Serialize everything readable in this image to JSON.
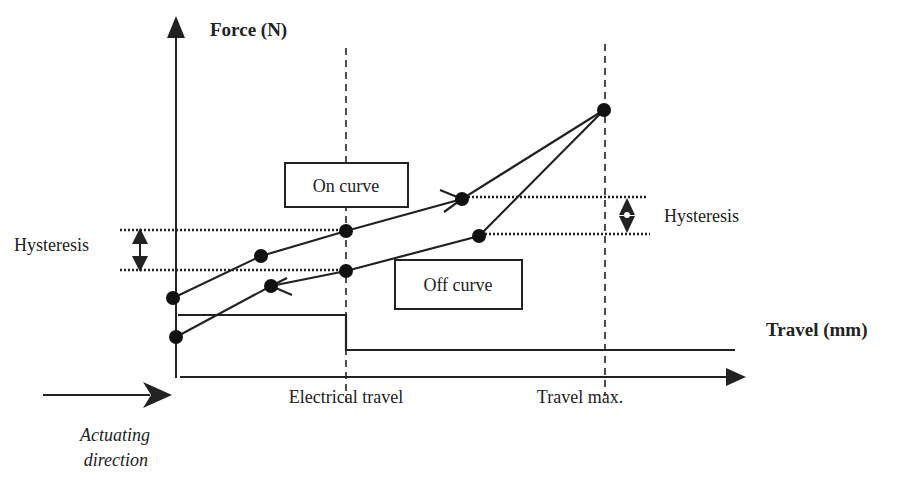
{
  "axes": {
    "y_label": "Force (N)",
    "x_label": "Travel (mm)"
  },
  "labels": {
    "on_curve": "On curve",
    "off_curve": "Off curve",
    "hysteresis_left": "Hysteresis",
    "hysteresis_right": "Hysteresis",
    "electrical_travel": "Electrical travel",
    "travel_max": "Travel max.",
    "actuating_line1": "Actuating",
    "actuating_line2": "direction"
  },
  "colors": {
    "ink": "#222222",
    "background": "#ffffff"
  }
}
